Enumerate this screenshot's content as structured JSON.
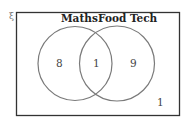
{
  "diagram": {
    "type": "venn",
    "universal_symbol": "ξ",
    "sets": [
      {
        "name": "Maths",
        "only_count": "8"
      },
      {
        "name": "Food Tech",
        "only_count": "9"
      }
    ],
    "intersection_count": "1",
    "outside_count": "1",
    "colors": {
      "frame": "#333333",
      "circle": "#7a7a7a",
      "text": "#222222"
    }
  }
}
